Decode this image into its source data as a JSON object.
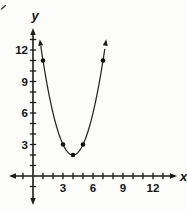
{
  "figure": {
    "type": "textbook-parabola-graph",
    "background_color": "#fcfcfa",
    "ink_color": "#1c1c1c"
  },
  "chart_data": {
    "type": "line",
    "title": "",
    "xlabel": "x",
    "ylabel": "y",
    "grid": false,
    "legend": false,
    "x_axis": {
      "ticks": [
        -1,
        1,
        2,
        3,
        4,
        5,
        6,
        7,
        8,
        9,
        10,
        11,
        12,
        13
      ],
      "labeled_ticks": [
        3,
        6,
        9,
        12
      ],
      "arrows": "both-ends"
    },
    "y_axis": {
      "ticks": [
        -1,
        1,
        2,
        3,
        4,
        5,
        6,
        7,
        8,
        9,
        10,
        11,
        12,
        13
      ],
      "labeled_ticks": [
        3,
        6,
        9,
        12
      ],
      "arrows": "both-ends"
    },
    "series": [
      {
        "name": "parabola",
        "equation": "y = (x - 4)^2 + 2",
        "a": 1,
        "vertex": [
          4,
          2
        ],
        "drawn_domain": [
          0.78,
          7.22
        ],
        "end_arrows": true,
        "marked_points": [
          [
            1,
            11
          ],
          [
            3,
            3
          ],
          [
            4,
            2
          ],
          [
            5,
            3
          ],
          [
            7,
            11
          ]
        ]
      }
    ]
  }
}
